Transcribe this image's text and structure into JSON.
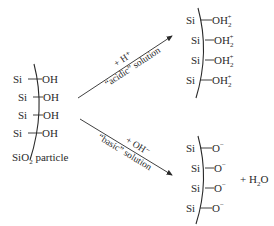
{
  "diagram": {
    "left_particle": {
      "groups": [
        {
          "si": "Si",
          "group": "OH"
        },
        {
          "si": "Si",
          "group": "OH"
        },
        {
          "si": "Si",
          "group": "OH"
        },
        {
          "si": "Si",
          "group": "OH"
        }
      ],
      "caption_prefix": "SiO",
      "caption_sub": "2",
      "caption_suffix": " particle"
    },
    "acidic_arrow": {
      "reagent": "+ H⁺",
      "condition": "“acidic” solution"
    },
    "basic_arrow": {
      "reagent": "+ OH⁻",
      "condition": "“basic” solution"
    },
    "acidic_product": {
      "groups": [
        {
          "si": "Si",
          "group": "OH",
          "sub": "2",
          "charge": "+"
        },
        {
          "si": "Si",
          "group": "OH",
          "sub": "2",
          "charge": "+"
        },
        {
          "si": "Si",
          "group": "OH",
          "sub": "2",
          "charge": "+"
        },
        {
          "si": "Si",
          "group": "OH",
          "sub": "2",
          "charge": "+"
        }
      ]
    },
    "basic_product": {
      "groups": [
        {
          "si": "Si",
          "group": "O",
          "charge": "−"
        },
        {
          "si": "Si",
          "group": "O",
          "charge": "−"
        },
        {
          "si": "Si",
          "group": "O",
          "charge": "−"
        },
        {
          "si": "Si",
          "group": "O",
          "charge": "−"
        }
      ],
      "byproduct_prefix": "+ H",
      "byproduct_sub": "2",
      "byproduct_suffix": "O"
    }
  }
}
